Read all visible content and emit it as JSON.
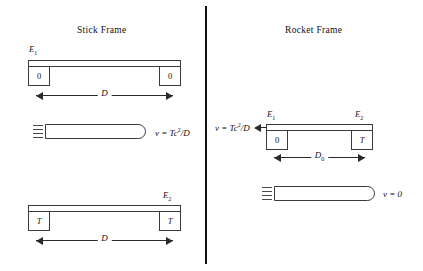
{
  "figure": {
    "panels": {
      "left": {
        "title": "Stick Frame",
        "diagrams": {
          "stick_top": {
            "event_label": "E",
            "event_sub": "1",
            "left_clock": "0",
            "right_clock": "0",
            "dimension_label": "D",
            "dimension_sub": ""
          },
          "rocket": {
            "velocity_label_prefix": "v = Tc",
            "velocity_exponent": "2",
            "velocity_label_suffix": "/D"
          },
          "stick_bottom": {
            "event_label": "E",
            "event_sub": "2",
            "left_clock": "T",
            "right_clock": "T",
            "dimension_label": "D",
            "dimension_sub": ""
          }
        }
      },
      "right": {
        "title": "Rocket Frame",
        "diagrams": {
          "stick": {
            "event_label_left": "E",
            "event_sub_left": "1",
            "event_label_right": "E",
            "event_sub_right": "2",
            "left_clock": "0",
            "right_clock": "T",
            "dimension_label": "D",
            "dimension_sub": "0",
            "velocity_label_prefix": "v = Tc",
            "velocity_exponent": "2",
            "velocity_label_suffix": "/D"
          },
          "rocket": {
            "velocity_label": "v = 0"
          }
        }
      }
    },
    "colors": {
      "ink": "#1a1a1a",
      "outline": "#3a3a3a",
      "divider": "#111111",
      "background": "#ffffff"
    }
  }
}
